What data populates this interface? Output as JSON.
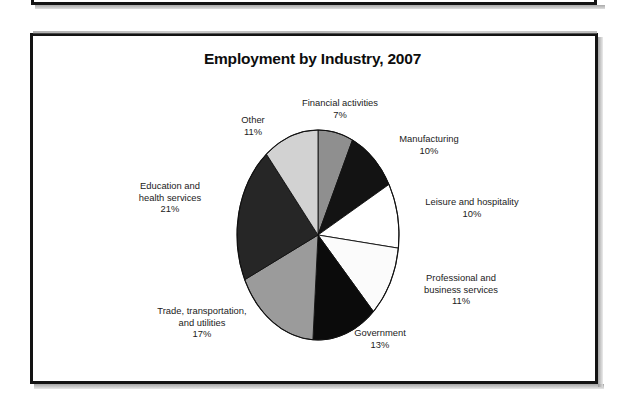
{
  "figure": {
    "title": "Employment by Industry, 2007"
  },
  "chart_data": {
    "type": "pie",
    "title": "Employment by Industry, 2007",
    "xlabel": "",
    "ylabel": "",
    "legend_position": "none",
    "grid": false,
    "labels": [
      "Financial activities",
      "Manufacturing",
      "Leisure and hospitality",
      "Professional and business services",
      "Government",
      "Trade, transportation, and utilities",
      "Education and health services",
      "Other"
    ],
    "values": [
      7,
      10,
      10,
      11,
      13,
      17,
      21,
      11
    ],
    "value_labels": [
      "7%",
      "10%",
      "10%",
      "11%",
      "13%",
      "17%",
      "21%",
      "11%"
    ],
    "slices": [
      {
        "name": "Financial activities",
        "value": 7,
        "value_label": "7%",
        "label_line1": "Financial activities",
        "label_line2": "",
        "fill": "#8f8f8f"
      },
      {
        "name": "Manufacturing",
        "value": 10,
        "value_label": "10%",
        "label_line1": "Manufacturing",
        "label_line2": "",
        "fill": "#131313"
      },
      {
        "name": "Leisure and hospitality",
        "value": 10,
        "value_label": "10%",
        "label_line1": "Leisure and hospitality",
        "label_line2": "",
        "fill": "#ffffff"
      },
      {
        "name": "Professional and business services",
        "value": 11,
        "value_label": "11%",
        "label_line1": "Professional and",
        "label_line2": "business services",
        "fill": "#fbfbfb"
      },
      {
        "name": "Government",
        "value": 13,
        "value_label": "13%",
        "label_line1": "Government",
        "label_line2": "",
        "fill": "#0b0b0b"
      },
      {
        "name": "Trade, transportation, and utilities",
        "value": 17,
        "value_label": "17%",
        "label_line1": "Trade, transportation,",
        "label_line2": "and utilities",
        "fill": "#9b9b9b"
      },
      {
        "name": "Education and health services",
        "value": 21,
        "value_label": "21%",
        "label_line1": "Education and",
        "label_line2": "health services",
        "fill": "#262626"
      },
      {
        "name": "Other",
        "value": 11,
        "value_label": "11%",
        "label_line1": "Other",
        "label_line2": "",
        "fill": "#d2d2d2"
      }
    ],
    "colors": {
      "outline": "#111111",
      "background": "#ffffff",
      "text": "#1b1b1b"
    }
  }
}
